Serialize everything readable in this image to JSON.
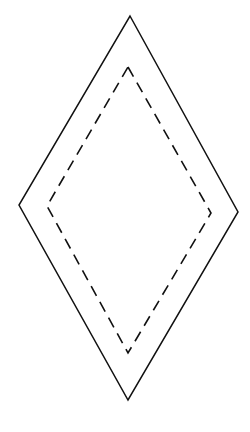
{
  "diagram": {
    "background": "#ffffff",
    "stroke_color": "#111111",
    "outer_diamond": {
      "style": "solid",
      "points": "130,16 238,212 128,400 19,205"
    },
    "inner_diamond": {
      "style": "dashed",
      "dash": "11,7",
      "points": "128,67 211,213 128,353 47,206"
    }
  }
}
